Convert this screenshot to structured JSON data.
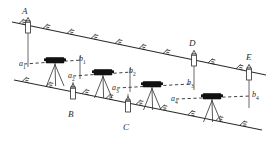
{
  "diagram": {
    "type": "surveying-leveling-diagram",
    "colors": {
      "line": "#2b2b2b",
      "instrument_body": "#111111",
      "label": "#2b2b2b",
      "dashed_sight": "#2b2b2b",
      "staff_fill": "#ffffff"
    },
    "station_points": [
      {
        "id": "A",
        "label": "A",
        "x": 23,
        "y": 12,
        "staff_x": 28,
        "staff_y": 22,
        "on_line": "upper"
      },
      {
        "id": "B",
        "label": "B",
        "x": 69,
        "y": 108,
        "staff_x": 73,
        "staff_y": 88,
        "on_line": "lower"
      },
      {
        "id": "C",
        "label": "C",
        "x": 124,
        "y": 121,
        "staff_x": 128,
        "staff_y": 101,
        "on_line": "lower"
      },
      {
        "id": "D",
        "label": "D",
        "x": 190,
        "y": 44,
        "staff_x": 194,
        "staff_y": 55,
        "on_line": "upper"
      },
      {
        "id": "E",
        "label": "E",
        "x": 247,
        "y": 58,
        "staff_x": 249,
        "staff_y": 69,
        "on_line": "upper"
      }
    ],
    "readings": [
      {
        "id": "a1",
        "label": "a",
        "sub": "1",
        "x": 23,
        "y": 66
      },
      {
        "id": "b1",
        "label": "b",
        "sub": "1",
        "x": 81,
        "y": 62
      },
      {
        "id": "a2",
        "label": "a",
        "sub": "2",
        "x": 72,
        "y": 78
      },
      {
        "id": "b2",
        "label": "b",
        "sub": "2",
        "x": 131,
        "y": 74
      },
      {
        "id": "a3",
        "label": "a",
        "sub": "3",
        "x": 116,
        "y": 90
      },
      {
        "id": "b3",
        "label": "b",
        "sub": "3",
        "x": 189,
        "y": 86
      },
      {
        "id": "a4",
        "label": "a",
        "sub": "4",
        "x": 175,
        "y": 101
      },
      {
        "id": "b4",
        "label": "b",
        "sub": "4",
        "x": 250,
        "y": 98
      }
    ],
    "instruments": [
      {
        "id": "level-1",
        "name": "level-instrument-1",
        "x": 55,
        "y": 63
      },
      {
        "id": "level-2",
        "name": "level-instrument-2",
        "x": 103,
        "y": 75
      },
      {
        "id": "level-3",
        "name": "level-instrument-3",
        "x": 152,
        "y": 87
      },
      {
        "id": "level-4",
        "name": "level-instrument-4",
        "x": 212,
        "y": 99
      }
    ],
    "sight_lines": [
      {
        "id": "sight-1",
        "x1": 24,
        "y1": 64,
        "x2": 82,
        "y2": 60
      },
      {
        "id": "sight-2",
        "x1": 73,
        "y1": 76,
        "x2": 132,
        "y2": 72
      },
      {
        "id": "sight-3",
        "x1": 117,
        "y1": 88,
        "x2": 190,
        "y2": 84
      },
      {
        "id": "sight-4",
        "x1": 176,
        "y1": 99,
        "x2": 251,
        "y2": 96
      }
    ],
    "terrain_lines": [
      {
        "id": "upper-ground-line",
        "x1": 12,
        "y1": 22,
        "x2": 266,
        "y2": 75
      },
      {
        "id": "lower-ground-line",
        "x1": 14,
        "y1": 80,
        "x2": 262,
        "y2": 130
      }
    ]
  }
}
